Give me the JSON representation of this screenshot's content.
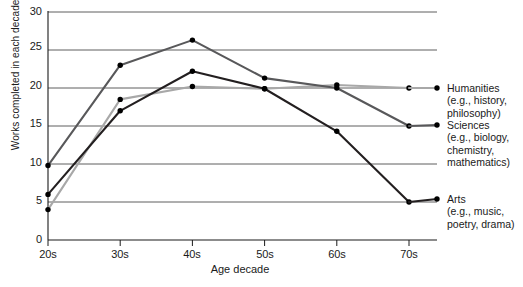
{
  "chart_data": {
    "type": "line",
    "title": "",
    "xlabel": "Age decade",
    "ylabel": "Works completed in each decade (%)",
    "categories": [
      "20s",
      "30s",
      "40s",
      "50s",
      "60s",
      "70s"
    ],
    "ylim": [
      0,
      30
    ],
    "yticks": [
      0,
      5,
      10,
      15,
      20,
      25,
      30
    ],
    "grid": true,
    "legend_position": "right",
    "series": [
      {
        "name": "Humanities",
        "sublabel": "(e.g., history, philosophy)",
        "color": "#a8a8a8",
        "values": [
          4.0,
          18.5,
          20.2,
          19.9,
          20.4,
          20.0
        ]
      },
      {
        "name": "Sciences",
        "sublabel": "(e.g., biology, chemistry, mathematics)",
        "color": "#58585a",
        "values": [
          9.8,
          23.0,
          26.3,
          21.3,
          20.0,
          15.0
        ]
      },
      {
        "name": "Arts",
        "sublabel": "(e.g., music, poetry, drama)",
        "color": "#231f20",
        "values": [
          6.0,
          17.0,
          22.2,
          19.9,
          14.3,
          5.0
        ]
      }
    ]
  },
  "axis": {
    "ylabel": "Works completed in each decade (%)",
    "xlabel": "Age decade",
    "yticks": [
      "0",
      "5",
      "10",
      "15",
      "20",
      "25",
      "30"
    ],
    "xticks": [
      "20s",
      "30s",
      "40s",
      "50s",
      "60s",
      "70s"
    ]
  },
  "legend": {
    "items": [
      {
        "name": "Humanities",
        "line1": "(e.g., history,",
        "line2": "philosophy)"
      },
      {
        "name": "Sciences",
        "line1": "(e.g., biology,",
        "line2": "chemistry,",
        "line3": "mathematics)"
      },
      {
        "name": "Arts",
        "line1": "(e.g., music,",
        "line2": "poetry, drama)"
      }
    ]
  }
}
